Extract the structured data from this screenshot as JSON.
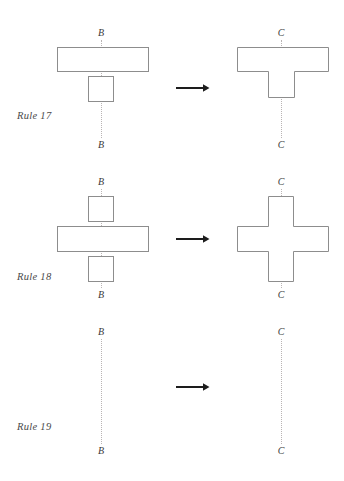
{
  "figure": {
    "type": "diagram",
    "background_color": "#ffffff",
    "shape_stroke_color": "#8d8d8d",
    "shape_fill_color": "#ffffff",
    "axis_line_color": "#b9b4b4",
    "arrow_color": "#1d1d1d",
    "text_color": "#3a3a3a"
  },
  "rules": [
    {
      "id": "rule-17",
      "label": "Rule 17",
      "left": {
        "axis_top_label": "B",
        "axis_bottom_label": "B",
        "shapes": [
          {
            "name": "wide-bar",
            "kind": "rectangle",
            "x": 57,
            "y": 47,
            "width": 92,
            "height": 25
          },
          {
            "name": "small-square",
            "kind": "rectangle",
            "x": 88,
            "y": 76,
            "width": 26,
            "height": 26
          }
        ]
      },
      "right": {
        "axis_top_label": "C",
        "axis_bottom_label": "C",
        "shapes": [
          {
            "name": "tee-shape",
            "kind": "polygon",
            "points": "237,47 329,47 329,72 294,72 294,98 268,98 268,72 237,72"
          }
        ]
      },
      "arrow": {
        "name": "rewrite-arrow",
        "glyph": "→"
      }
    },
    {
      "id": "rule-18",
      "label": "Rule 18",
      "left": {
        "axis_top_label": "B",
        "axis_bottom_label": "B",
        "shapes": [
          {
            "name": "top-square",
            "kind": "rectangle",
            "x": 88,
            "y": 196,
            "width": 26,
            "height": 26
          },
          {
            "name": "wide-bar",
            "kind": "rectangle",
            "x": 57,
            "y": 226,
            "width": 92,
            "height": 26
          },
          {
            "name": "bottom-square",
            "kind": "rectangle",
            "x": 88,
            "y": 256,
            "width": 26,
            "height": 26
          }
        ]
      },
      "right": {
        "axis_top_label": "C",
        "axis_bottom_label": "C",
        "shapes": [
          {
            "name": "cross-shape",
            "kind": "polygon",
            "points": "268,196 294,196 294,226 329,226 329,252 294,252 294,282 268,282 268,252 237,252 237,226 268,226"
          }
        ]
      },
      "arrow": {
        "name": "rewrite-arrow",
        "glyph": "→"
      }
    },
    {
      "id": "rule-19",
      "label": "Rule 19",
      "left": {
        "axis_top_label": "B",
        "axis_bottom_label": "B",
        "shapes": []
      },
      "right": {
        "axis_top_label": "C",
        "axis_bottom_label": "C",
        "shapes": []
      },
      "arrow": {
        "name": "rewrite-arrow",
        "glyph": "→"
      }
    }
  ]
}
